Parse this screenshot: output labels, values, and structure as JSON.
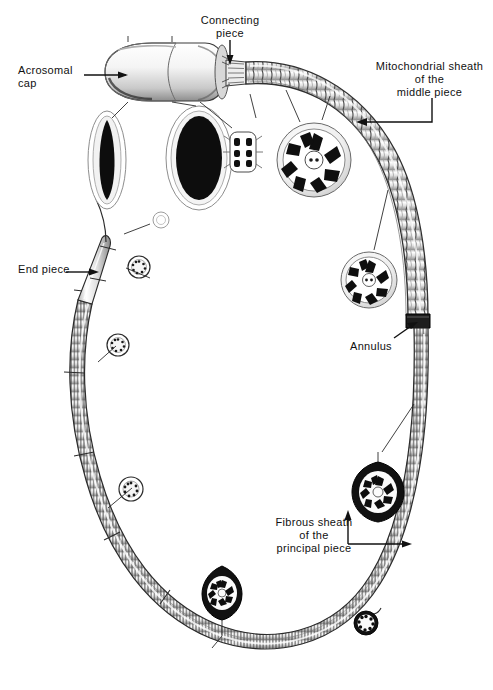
{
  "figure": {
    "type": "anatomical-diagram",
    "background_color": "#ffffff",
    "ink_color": "#111111"
  },
  "labels": [
    {
      "id": "acrosomal-cap",
      "text": "Acrosomal\ncap",
      "x": 18,
      "y": 64,
      "align": "left",
      "leader": "horizontal-arrow-right"
    },
    {
      "id": "connecting-piece",
      "text": "Connecting\npiece",
      "x": 189,
      "y": 14,
      "align": "center",
      "leader": "vertical-arrow-down"
    },
    {
      "id": "mitochondrial-sheath",
      "text": "Mitochondrial sheath\nof the\nmiddle piece",
      "x": 366,
      "y": 60,
      "align": "center",
      "leader": "bracket-arrow-left"
    },
    {
      "id": "end-piece",
      "text": "End piece",
      "x": 18,
      "y": 262,
      "align": "left",
      "leader": "horizontal-arrow-right"
    },
    {
      "id": "annulus",
      "text": "Annulus",
      "x": 350,
      "y": 340,
      "align": "left",
      "leader": "diagonal-arrow-up-right"
    },
    {
      "id": "fibrous-sheath",
      "text": "Fibrous sheath\nof the\nprincipal piece",
      "x": 270,
      "y": 516,
      "align": "center",
      "leader": "bracket-arrow-split"
    }
  ],
  "structures": [
    {
      "id": "head",
      "name": "head-with-acrosomal-cap"
    },
    {
      "id": "neck",
      "name": "connecting-piece"
    },
    {
      "id": "middle-piece",
      "name": "mitochondrial-sheath-middle-piece"
    },
    {
      "id": "annulus-ring",
      "name": "annulus"
    },
    {
      "id": "principal-piece",
      "name": "principal-piece-fibrous-sheath"
    },
    {
      "id": "end-piece-tail",
      "name": "end-piece"
    }
  ],
  "cross_sections": [
    {
      "id": "head-section-narrow",
      "name": "head-cross-section-sagittal",
      "cx": 107,
      "cy": 160
    },
    {
      "id": "head-section-wide",
      "name": "head-cross-section-frontal",
      "cx": 199,
      "cy": 158
    },
    {
      "id": "neck-section",
      "name": "connecting-piece-cross-section",
      "cx": 243,
      "cy": 152
    },
    {
      "id": "middle-section-upper",
      "name": "middle-piece-cross-section",
      "cx": 314,
      "cy": 160
    },
    {
      "id": "middle-section-lower",
      "name": "middle-piece-cross-section",
      "cx": 369,
      "cy": 280
    },
    {
      "id": "principal-section-right",
      "name": "principal-piece-cross-section",
      "cx": 378,
      "cy": 490
    },
    {
      "id": "principal-section-lower",
      "name": "principal-piece-cross-section",
      "cx": 222,
      "cy": 593
    },
    {
      "id": "principal-section-small",
      "name": "principal-piece-cross-section",
      "cx": 366,
      "cy": 623
    },
    {
      "id": "end-section-a",
      "name": "end-piece-cross-section",
      "cx": 139,
      "cy": 267
    },
    {
      "id": "end-section-b",
      "name": "end-piece-cross-section",
      "cx": 118,
      "cy": 345
    },
    {
      "id": "end-section-c",
      "name": "end-piece-cross-section",
      "cx": 161,
      "cy": 220
    },
    {
      "id": "end-section-d",
      "name": "end-piece-cross-section",
      "cx": 131,
      "cy": 489
    }
  ]
}
